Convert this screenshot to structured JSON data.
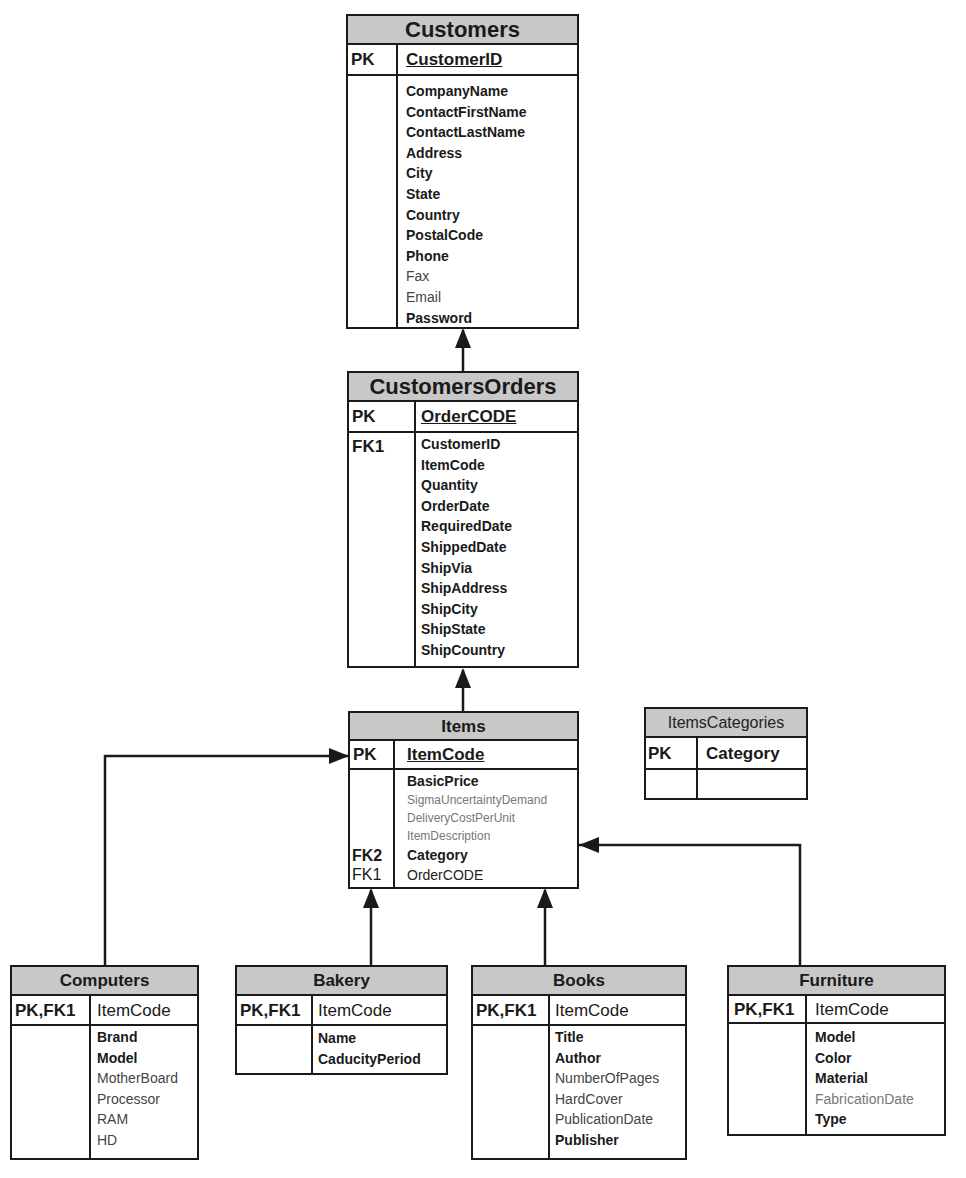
{
  "tables": {
    "customers": {
      "title": "Customers",
      "pk_label": "PK",
      "pk_field": "CustomerID",
      "fields": [
        "CompanyName",
        "ContactFirstName",
        "ContactLastName",
        "Address",
        "City",
        "State",
        "Country",
        "PostalCode",
        "Phone",
        "Fax",
        "Email",
        "Password"
      ]
    },
    "customers_orders": {
      "title": "CustomersOrders",
      "pk_label": "PK",
      "pk_field": "OrderCODE",
      "fk_label": "FK1",
      "fields": [
        "CustomerID",
        "ItemCode",
        "Quantity",
        "OrderDate",
        "RequiredDate",
        "ShippedDate",
        "ShipVia",
        "ShipAddress",
        "ShipCity",
        "ShipState",
        "ShipCountry"
      ]
    },
    "items": {
      "title": "Items",
      "pk_label": "PK",
      "pk_field": "ItemCode",
      "fk2_label": "FK2",
      "fk1_label": "FK1",
      "fields": [
        "BasicPrice",
        "SigmaUncertaintyDemand",
        "DeliveryCostPerUnit",
        "ItemDescription",
        "Category",
        "OrderCODE"
      ]
    },
    "items_categories": {
      "title": "ItemsCategories",
      "pk_label": "PK",
      "pk_field": "Category"
    },
    "computers": {
      "title": "Computers",
      "pk_label": "PK,FK1",
      "pk_field": "ItemCode",
      "fields": [
        "Brand",
        "Model",
        "MotherBoard",
        "Processor",
        "RAM",
        "HD"
      ]
    },
    "bakery": {
      "title": "Bakery",
      "pk_label": "PK,FK1",
      "pk_field": "ItemCode",
      "fields": [
        "Name",
        "CaducityPeriod"
      ]
    },
    "books": {
      "title": "Books",
      "pk_label": "PK,FK1",
      "pk_field": "ItemCode",
      "fields": [
        "Title",
        "Author",
        "NumberOfPages",
        "HardCover",
        "PublicationDate",
        "Publisher"
      ]
    },
    "furniture": {
      "title": "Furniture",
      "pk_label": "PK,FK1",
      "pk_field": "ItemCode",
      "fields": [
        "Model",
        "Color",
        "Material",
        "FabricationDate",
        "Type"
      ]
    }
  },
  "colors": {
    "header_fill": "#c8c8c8",
    "line": "#1a1a1a"
  }
}
